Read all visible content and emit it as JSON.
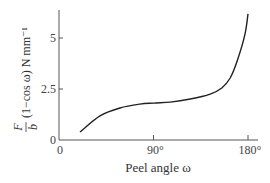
{
  "chart_data": {
    "type": "line",
    "title": "",
    "xlabel": "Peel angle ω",
    "ylabel_parts": {
      "numerator": "F",
      "denominator": "b",
      "rest": "(1−cos ω) N mm⁻¹"
    },
    "ylabel": "F/b (1−cos ω) N mm⁻¹",
    "xlim": [
      0,
      180
    ],
    "ylim": [
      0,
      6.3
    ],
    "x_ticks": [
      0,
      90,
      180
    ],
    "x_tick_labels": [
      "0",
      "90°",
      "180°"
    ],
    "y_ticks": [
      0,
      2.5,
      5
    ],
    "y_tick_labels": [
      "0",
      "2.5",
      "5"
    ],
    "grid": false,
    "legend": null,
    "series": [
      {
        "name": "F/b (1−cos ω)",
        "color": "#222222",
        "x": [
          20,
          39,
          58,
          77,
          90,
          106,
          125,
          144,
          155,
          163,
          170,
          177,
          180
        ],
        "y": [
          0.39,
          1.18,
          1.57,
          1.76,
          1.81,
          1.86,
          2.01,
          2.25,
          2.55,
          3.04,
          3.92,
          5.15,
          6.18
        ]
      }
    ]
  }
}
